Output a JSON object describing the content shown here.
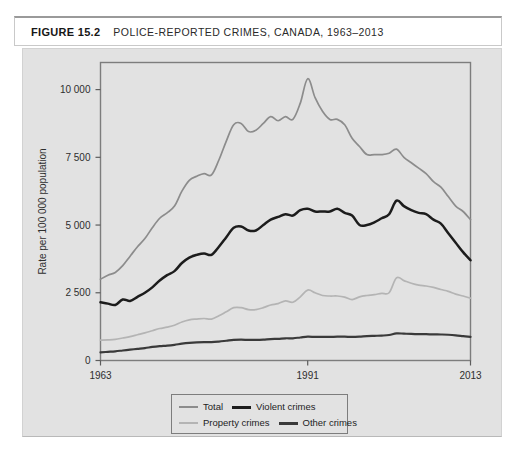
{
  "header": {
    "figure_number": "FIGURE 15.2",
    "title": "POLICE-REPORTED CRIMES, CANADA, 1963–2013"
  },
  "colors": {
    "panel_background": "#e2e2e2",
    "plot_border": "#7d7d7d",
    "total": "#8c8c8c",
    "violent": "#1c1c1c",
    "property": "#b4b4b4",
    "other": "#3a3a3a",
    "axis_text": "#2e2e2e"
  },
  "legend": {
    "items": [
      {
        "label": "Total",
        "key": "total",
        "color": "#8c8c8c",
        "width": 1.6
      },
      {
        "label": "Violent crimes",
        "key": "violent",
        "color": "#1c1c1c",
        "width": 2.4
      },
      {
        "label": "Property crimes",
        "key": "property",
        "color": "#b4b4b4",
        "width": 1.6
      },
      {
        "label": "Other crimes",
        "key": "other",
        "color": "#3a3a3a",
        "width": 2.2
      }
    ]
  },
  "chart_data": {
    "type": "line",
    "title": "POLICE-REPORTED CRIMES, CANADA, 1963–2013",
    "xlabel": "",
    "ylabel": "Rate per 100 000 population",
    "xlim": [
      1963,
      2013
    ],
    "ylim": [
      0,
      11000
    ],
    "grid": false,
    "legend_position": "bottom-center",
    "xticks": [
      1963,
      1991,
      2013
    ],
    "xtick_labels": [
      "1963",
      "1991",
      "2013"
    ],
    "yticks": [
      0,
      2500,
      5000,
      7500,
      10000
    ],
    "ytick_labels": [
      "0",
      "2 500",
      "5 000",
      "7 500",
      "10 000"
    ],
    "x": [
      1963,
      1964,
      1965,
      1966,
      1967,
      1968,
      1969,
      1970,
      1971,
      1972,
      1973,
      1974,
      1975,
      1976,
      1977,
      1978,
      1979,
      1980,
      1981,
      1982,
      1983,
      1984,
      1985,
      1986,
      1987,
      1988,
      1989,
      1990,
      1991,
      1992,
      1993,
      1994,
      1995,
      1996,
      1997,
      1998,
      1999,
      2000,
      2001,
      2002,
      2003,
      2004,
      2005,
      2006,
      2007,
      2008,
      2009,
      2010,
      2011,
      2012,
      2013
    ],
    "series": [
      {
        "name": "Total",
        "color": "#8c8c8c",
        "values": [
          3000,
          3150,
          3250,
          3500,
          3850,
          4200,
          4500,
          4900,
          5250,
          5450,
          5700,
          6250,
          6650,
          6800,
          6900,
          6850,
          7400,
          8100,
          8700,
          8750,
          8450,
          8500,
          8750,
          9000,
          8850,
          9000,
          8900,
          9500,
          10400,
          9700,
          9200,
          8900,
          8900,
          8700,
          8200,
          7900,
          7600,
          7600,
          7600,
          7650,
          7800,
          7500,
          7300,
          7100,
          6900,
          6600,
          6400,
          6050,
          5700,
          5500,
          5200
        ]
      },
      {
        "name": "Violent crimes",
        "color": "#1c1c1c",
        "values": [
          2150,
          2100,
          2050,
          2250,
          2200,
          2350,
          2500,
          2700,
          2950,
          3150,
          3300,
          3600,
          3800,
          3900,
          3950,
          3900,
          4200,
          4550,
          4900,
          4950,
          4800,
          4800,
          5000,
          5200,
          5300,
          5400,
          5350,
          5550,
          5600,
          5500,
          5500,
          5500,
          5600,
          5450,
          5350,
          5000,
          5000,
          5100,
          5250,
          5400,
          5900,
          5700,
          5550,
          5450,
          5400,
          5200,
          5050,
          4700,
          4350,
          4000,
          3700
        ]
      },
      {
        "name": "Property crimes",
        "color": "#b4b4b4",
        "values": [
          750,
          760,
          780,
          830,
          880,
          950,
          1020,
          1100,
          1180,
          1230,
          1300,
          1420,
          1500,
          1530,
          1550,
          1530,
          1650,
          1800,
          1950,
          1950,
          1880,
          1880,
          1950,
          2050,
          2100,
          2200,
          2150,
          2350,
          2600,
          2500,
          2400,
          2380,
          2380,
          2340,
          2250,
          2350,
          2400,
          2430,
          2480,
          2500,
          3050,
          2950,
          2850,
          2780,
          2750,
          2700,
          2620,
          2550,
          2450,
          2380,
          2300
        ]
      },
      {
        "name": "Other crimes",
        "color": "#3a3a3a",
        "values": [
          300,
          320,
          340,
          370,
          400,
          430,
          460,
          500,
          530,
          550,
          580,
          620,
          650,
          670,
          680,
          680,
          700,
          730,
          760,
          770,
          760,
          760,
          770,
          790,
          800,
          820,
          820,
          850,
          880,
          870,
          870,
          870,
          880,
          880,
          870,
          880,
          900,
          910,
          920,
          940,
          1000,
          990,
          980,
          975,
          970,
          965,
          960,
          950,
          930,
          900,
          870
        ]
      }
    ]
  }
}
